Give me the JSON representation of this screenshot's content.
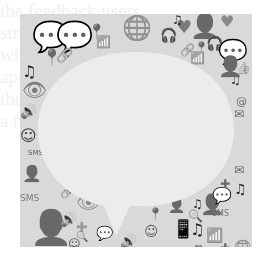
{
  "image": {
    "description": "Grayscale mosaic of social media icons surrounding a blank speech bubble",
    "background_text": [
      "the feedback users",
      "strive in a later ve",
      "when it all turn ou",
      "applied by users on",
      "the Bitcoin network",
      "a note to user"
    ],
    "colors": {
      "page_bg": "#ffffff",
      "mosaic_bg": "#d9d9d9",
      "bubble_fill": "#ececec",
      "icon_dark": "#1e1e1e",
      "icon_mid": "#5a5a5a",
      "icon_light": "#9a9a9a"
    },
    "icons": [
      {
        "name": "speech-bubble-icon",
        "glyph": "💬",
        "x": 12,
        "y": 8,
        "s": 30,
        "c": "#1e1e1e"
      },
      {
        "name": "speech-bubble-icon",
        "glyph": "💬",
        "x": 36,
        "y": 8,
        "s": 30,
        "c": "#5a5a5a"
      },
      {
        "name": "globe-icon",
        "glyph": "🌐",
        "x": 102,
        "y": 2,
        "s": 24,
        "c": "#1e1e1e"
      },
      {
        "name": "user-icon",
        "glyph": "👤",
        "x": 170,
        "y": 0,
        "s": 24,
        "c": "#1e1e1e"
      },
      {
        "name": "heart-icon",
        "glyph": "♥",
        "x": 156,
        "y": 4,
        "s": 18,
        "c": "#7a7a7a"
      },
      {
        "name": "heart-icon",
        "glyph": "♥",
        "x": 200,
        "y": 0,
        "s": 16,
        "c": "#8a8a8a"
      },
      {
        "name": "headphones-icon",
        "glyph": "🎧",
        "x": 140,
        "y": 14,
        "s": 14,
        "c": "#3a3a3a"
      },
      {
        "name": "headphones-icon",
        "glyph": "🎧",
        "x": 186,
        "y": 22,
        "s": 14,
        "c": "#3a3a3a"
      },
      {
        "name": "speech-bubble-icon",
        "glyph": "💬",
        "x": 198,
        "y": 26,
        "s": 24,
        "c": "#4a4a4a"
      },
      {
        "name": "music-note-icon",
        "glyph": "♫",
        "x": 152,
        "y": 0,
        "s": 12,
        "c": "#2a2a2a"
      },
      {
        "name": "map-pin-icon",
        "glyph": "📍",
        "x": 68,
        "y": 10,
        "s": 14,
        "c": "#6a6a6a"
      },
      {
        "name": "map-pin-icon",
        "glyph": "📍",
        "x": 22,
        "y": 36,
        "s": 16,
        "c": "#2a2a2a"
      },
      {
        "name": "map-pin-icon",
        "glyph": "📍",
        "x": 174,
        "y": 28,
        "s": 12,
        "c": "#5a5a5a"
      },
      {
        "name": "link-icon",
        "glyph": "🔗",
        "x": 36,
        "y": 34,
        "s": 14,
        "c": "#7a7a7a"
      },
      {
        "name": "link-icon",
        "glyph": "🔗",
        "x": 160,
        "y": 30,
        "s": 12,
        "c": "#8a8a8a"
      },
      {
        "name": "music-note-icon",
        "glyph": "♫",
        "x": 2,
        "y": 50,
        "s": 16,
        "c": "#1e1e1e"
      },
      {
        "name": "music-note-icon",
        "glyph": "♫",
        "x": 210,
        "y": 60,
        "s": 12,
        "c": "#1e1e1e"
      },
      {
        "name": "user-icon",
        "glyph": "👤",
        "x": 198,
        "y": 42,
        "s": 20,
        "c": "#5a5a5a"
      },
      {
        "name": "thumbs-up-icon",
        "glyph": "👍",
        "x": 216,
        "y": 48,
        "s": 12,
        "c": "#5a5a5a"
      },
      {
        "name": "thumbs-up-icon",
        "glyph": "👍",
        "x": 30,
        "y": 78,
        "s": 10,
        "c": "#5a5a5a"
      },
      {
        "name": "eye-icon",
        "glyph": "👁",
        "x": 2,
        "y": 66,
        "s": 20,
        "c": "#7a7a7a"
      },
      {
        "name": "speaker-icon",
        "glyph": "🔊",
        "x": 0,
        "y": 90,
        "s": 14,
        "c": "#6a6a6a"
      },
      {
        "name": "wifi-icon",
        "glyph": "📶",
        "x": 76,
        "y": 22,
        "s": 12,
        "c": "#9a9a9a"
      },
      {
        "name": "wifi-icon",
        "glyph": "📶",
        "x": 170,
        "y": 38,
        "s": 12,
        "c": "#9a9a9a"
      },
      {
        "name": "smiley-icon",
        "glyph": "☺",
        "x": 0,
        "y": 114,
        "s": 16,
        "c": "#3a3a3a"
      },
      {
        "name": "email-icon",
        "glyph": "✉",
        "x": 214,
        "y": 94,
        "s": 12,
        "c": "#6a6a6a"
      },
      {
        "name": "at-icon",
        "glyph": "@",
        "x": 216,
        "y": 82,
        "s": 11,
        "c": "#6a6a6a"
      },
      {
        "name": "sms-icon",
        "glyph": "SMS",
        "x": 8,
        "y": 136,
        "s": 7,
        "c": "#5a5a5a"
      },
      {
        "name": "user-icon",
        "glyph": "👤",
        "x": 2,
        "y": 152,
        "s": 16,
        "c": "#1e1e1e"
      },
      {
        "name": "sms-icon",
        "glyph": "SMS",
        "x": 0,
        "y": 180,
        "s": 9,
        "c": "#7a7a7a"
      },
      {
        "name": "user-icon",
        "glyph": "👤",
        "x": 10,
        "y": 196,
        "s": 34,
        "c": "#5a5a5a"
      },
      {
        "name": "eye-icon",
        "glyph": "👁",
        "x": 56,
        "y": 178,
        "s": 20,
        "c": "#8a8a8a"
      },
      {
        "name": "link-icon",
        "glyph": "🔗",
        "x": 40,
        "y": 172,
        "s": 12,
        "c": "#2a2a2a"
      },
      {
        "name": "plus-icon",
        "glyph": "✚",
        "x": 56,
        "y": 206,
        "s": 14,
        "c": "#9a9a9a"
      },
      {
        "name": "speech-bubble-icon",
        "glyph": "💬",
        "x": 76,
        "y": 212,
        "s": 14,
        "c": "#2a2a2a"
      },
      {
        "name": "smiley-icon",
        "glyph": "☺",
        "x": 48,
        "y": 224,
        "s": 12,
        "c": "#4a4a4a"
      },
      {
        "name": "search-icon",
        "glyph": "🔍",
        "x": 56,
        "y": 218,
        "s": 10,
        "c": "#5a5a5a"
      },
      {
        "name": "speaker-icon",
        "glyph": "🔊",
        "x": 40,
        "y": 198,
        "s": 14,
        "c": "#6a6a6a"
      },
      {
        "name": "music-note-icon",
        "glyph": "♫",
        "x": 2,
        "y": 232,
        "s": 10,
        "c": "#1e1e1e"
      },
      {
        "name": "smiley-icon",
        "glyph": "☺",
        "x": 2,
        "y": 240,
        "s": 12,
        "c": "#3a3a3a"
      },
      {
        "name": "speech-bubble-icon",
        "glyph": "💬",
        "x": 122,
        "y": 234,
        "s": 14,
        "c": "#1e1e1e"
      },
      {
        "name": "smiley-icon",
        "glyph": "☺",
        "x": 124,
        "y": 210,
        "s": 14,
        "c": "#5a5a5a"
      },
      {
        "name": "map-pin-icon",
        "glyph": "📍",
        "x": 128,
        "y": 194,
        "s": 12,
        "c": "#3a3a3a"
      },
      {
        "name": "user-icon",
        "glyph": "👤",
        "x": 148,
        "y": 184,
        "s": 14,
        "c": "#1e1e1e"
      },
      {
        "name": "mobile-phone-icon",
        "glyph": "📱",
        "x": 152,
        "y": 206,
        "s": 18,
        "c": "#9a9a9a"
      },
      {
        "name": "music-note-icon",
        "glyph": "♫",
        "x": 170,
        "y": 208,
        "s": 16,
        "c": "#1e1e1e"
      },
      {
        "name": "music-note-icon",
        "glyph": "♫",
        "x": 172,
        "y": 184,
        "s": 12,
        "c": "#2a2a2a"
      },
      {
        "name": "user-icon",
        "glyph": "👤",
        "x": 180,
        "y": 180,
        "s": 20,
        "c": "#5a5a5a"
      },
      {
        "name": "sms-icon",
        "glyph": "SMS",
        "x": 192,
        "y": 196,
        "s": 8,
        "c": "#7a7a7a"
      },
      {
        "name": "search-icon",
        "glyph": "🔍",
        "x": 168,
        "y": 196,
        "s": 12,
        "c": "#5a5a5a"
      },
      {
        "name": "speech-bubble-icon",
        "glyph": "💬",
        "x": 192,
        "y": 174,
        "s": 16,
        "c": "#2a2a2a"
      },
      {
        "name": "music-note-icon",
        "glyph": "♫",
        "x": 214,
        "y": 168,
        "s": 14,
        "c": "#1e1e1e"
      },
      {
        "name": "plus-icon",
        "glyph": "✚",
        "x": 200,
        "y": 164,
        "s": 12,
        "c": "#6a6a6a"
      },
      {
        "name": "email-icon",
        "glyph": "✉",
        "x": 214,
        "y": 150,
        "s": 12,
        "c": "#6a6a6a"
      },
      {
        "name": "globe-icon",
        "glyph": "🌐",
        "x": 214,
        "y": 226,
        "s": 14,
        "c": "#1e1e1e"
      },
      {
        "name": "plus-icon",
        "glyph": "✚",
        "x": 200,
        "y": 228,
        "s": 12,
        "c": "#6a6a6a"
      },
      {
        "name": "email-icon",
        "glyph": "✉",
        "x": 140,
        "y": 240,
        "s": 12,
        "c": "#6a6a6a"
      },
      {
        "name": "speaker-icon",
        "glyph": "🔊",
        "x": 100,
        "y": 220,
        "s": 14,
        "c": "#6a6a6a"
      },
      {
        "name": "link-icon",
        "glyph": "🔗",
        "x": 100,
        "y": 238,
        "s": 12,
        "c": "#7a7a7a"
      },
      {
        "name": "wifi-icon",
        "glyph": "📶",
        "x": 186,
        "y": 214,
        "s": 14,
        "c": "#9a9a9a"
      },
      {
        "name": "user-icon",
        "glyph": "👤",
        "x": 186,
        "y": 236,
        "s": 14,
        "c": "#1e1e1e"
      },
      {
        "name": "heart-icon",
        "glyph": "♥",
        "x": 174,
        "y": 230,
        "s": 10,
        "c": "#8a8a8a"
      },
      {
        "name": "headphones-icon",
        "glyph": "🎧",
        "x": 220,
        "y": 240,
        "s": 10,
        "c": "#3a3a3a"
      }
    ]
  }
}
